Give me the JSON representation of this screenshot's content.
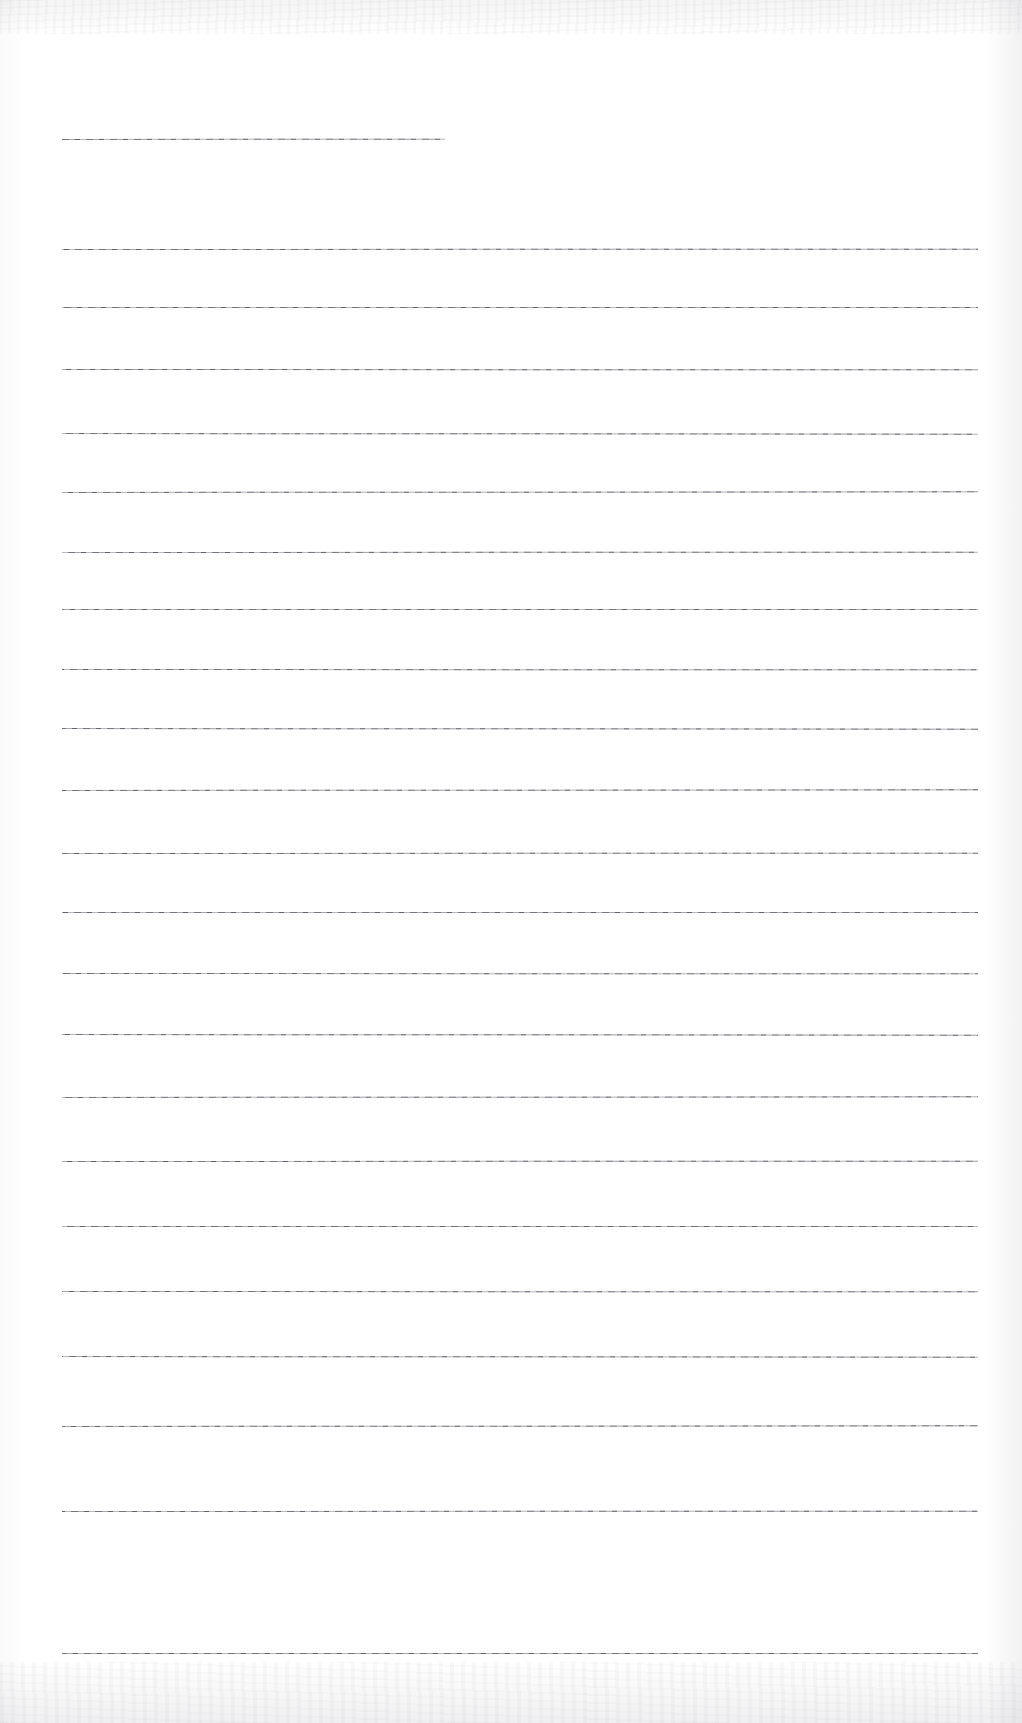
{
  "document": {
    "kind": "scanned-ruled-page",
    "title": "",
    "page_width": 1022,
    "page_height": 1723,
    "background_color": "#ffffff",
    "rule_color": "#6e6e74",
    "rule_thickness_px": 1,
    "text_content": [],
    "notes": "Blank scanned lined form page. No legible text, headings, labels, or numbers are present in the pixels."
  },
  "rules": {
    "count": 23,
    "left_margin_px": 62,
    "right_margin_px": 978,
    "short_rule_right_px": 445,
    "items": [
      {
        "id": "rule-1",
        "y": 138,
        "x1": 62,
        "x2": 445,
        "short": true
      },
      {
        "id": "rule-2",
        "y": 248,
        "x1": 62,
        "x2": 978,
        "short": false
      },
      {
        "id": "rule-3",
        "y": 306,
        "x1": 62,
        "x2": 978,
        "short": false
      },
      {
        "id": "rule-4",
        "y": 368,
        "x1": 62,
        "x2": 978,
        "short": false
      },
      {
        "id": "rule-5",
        "y": 432,
        "x1": 62,
        "x2": 978,
        "short": false
      },
      {
        "id": "rule-6",
        "y": 491,
        "x1": 62,
        "x2": 978,
        "short": false
      },
      {
        "id": "rule-7",
        "y": 551,
        "x1": 62,
        "x2": 978,
        "short": false
      },
      {
        "id": "rule-8",
        "y": 608,
        "x1": 62,
        "x2": 978,
        "short": false
      },
      {
        "id": "rule-9",
        "y": 668,
        "x1": 62,
        "x2": 978,
        "short": false
      },
      {
        "id": "rule-10",
        "y": 727,
        "x1": 62,
        "x2": 978,
        "short": false
      },
      {
        "id": "rule-11",
        "y": 789,
        "x1": 62,
        "x2": 978,
        "short": false
      },
      {
        "id": "rule-12",
        "y": 852,
        "x1": 62,
        "x2": 978,
        "short": false
      },
      {
        "id": "rule-13",
        "y": 911,
        "x1": 62,
        "x2": 978,
        "short": false
      },
      {
        "id": "rule-14",
        "y": 972,
        "x1": 62,
        "x2": 978,
        "short": false
      },
      {
        "id": "rule-15",
        "y": 1033,
        "x1": 62,
        "x2": 978,
        "short": false
      },
      {
        "id": "rule-16",
        "y": 1096,
        "x1": 62,
        "x2": 978,
        "short": false
      },
      {
        "id": "rule-17",
        "y": 1160,
        "x1": 62,
        "x2": 978,
        "short": false
      },
      {
        "id": "rule-18",
        "y": 1225,
        "x1": 62,
        "x2": 978,
        "short": false
      },
      {
        "id": "rule-19",
        "y": 1290,
        "x1": 62,
        "x2": 978,
        "short": false
      },
      {
        "id": "rule-20",
        "y": 1355,
        "x1": 62,
        "x2": 978,
        "short": false
      },
      {
        "id": "rule-21",
        "y": 1425,
        "x1": 62,
        "x2": 978,
        "short": false
      },
      {
        "id": "rule-22",
        "y": 1510,
        "x1": 62,
        "x2": 978,
        "short": false
      },
      {
        "id": "rule-23",
        "y": 1652,
        "x1": 62,
        "x2": 978,
        "short": false
      }
    ]
  },
  "scan_artifacts": {
    "top_band": {
      "y": 0,
      "height": 34,
      "tint": "#bebec3"
    },
    "bottom_band": {
      "y": 1662,
      "height": 61,
      "tint": "#b9b9c0"
    },
    "right_edge": {
      "x": 986,
      "width": 36,
      "tint": "#bcbcc2"
    },
    "left_edge": {
      "x": 0,
      "width": 26,
      "tint": "#c8c8cd"
    }
  }
}
